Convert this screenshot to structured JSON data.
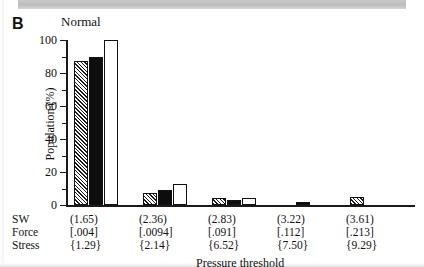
{
  "panel": {
    "label": "B",
    "title": "Normal"
  },
  "axes": {
    "ylabel": "Population (%)",
    "yticks": [
      "0",
      "20",
      "40",
      "60",
      "80",
      "100"
    ],
    "xlabel": "Pressure threshold",
    "row_labels": {
      "sw": "SW",
      "force": "Force",
      "stress": "Stress"
    }
  },
  "xlabels": {
    "sw": [
      "(1.65)",
      "(2.36)",
      "(2.83)",
      "(3.22)",
      "(3.61)"
    ],
    "force": [
      "[.004]",
      "[.0094]",
      "[.091]",
      "[.112]",
      "[.213]"
    ],
    "stress": [
      "{1.29}",
      "{2.14}",
      "{6.52}",
      "{7.50}",
      "{9.29}"
    ]
  },
  "chart_data": {
    "type": "bar",
    "title": "Normal",
    "xlabel": "Pressure threshold",
    "ylabel": "Population (%)",
    "ylim": [
      0,
      100
    ],
    "yticks": [
      0,
      20,
      40,
      60,
      80,
      100
    ],
    "grid": false,
    "legend": "none",
    "categories": [
      "(1.65)",
      "(2.36)",
      "(2.83)",
      "(3.22)",
      "(3.61)"
    ],
    "series": [
      {
        "name": "hatched",
        "fill": "hatched",
        "values": [
          87,
          7,
          4,
          0,
          5
        ]
      },
      {
        "name": "solid",
        "fill": "black",
        "values": [
          90,
          9,
          3,
          2,
          0
        ]
      },
      {
        "name": "open",
        "fill": "white",
        "values": [
          100,
          13,
          4,
          0,
          0
        ]
      }
    ]
  },
  "colors": {
    "ink": "#111111",
    "solid_bar": "#0d0d0d",
    "open_bar": "#ffffff",
    "scan_strip": "#c9c9c9"
  }
}
